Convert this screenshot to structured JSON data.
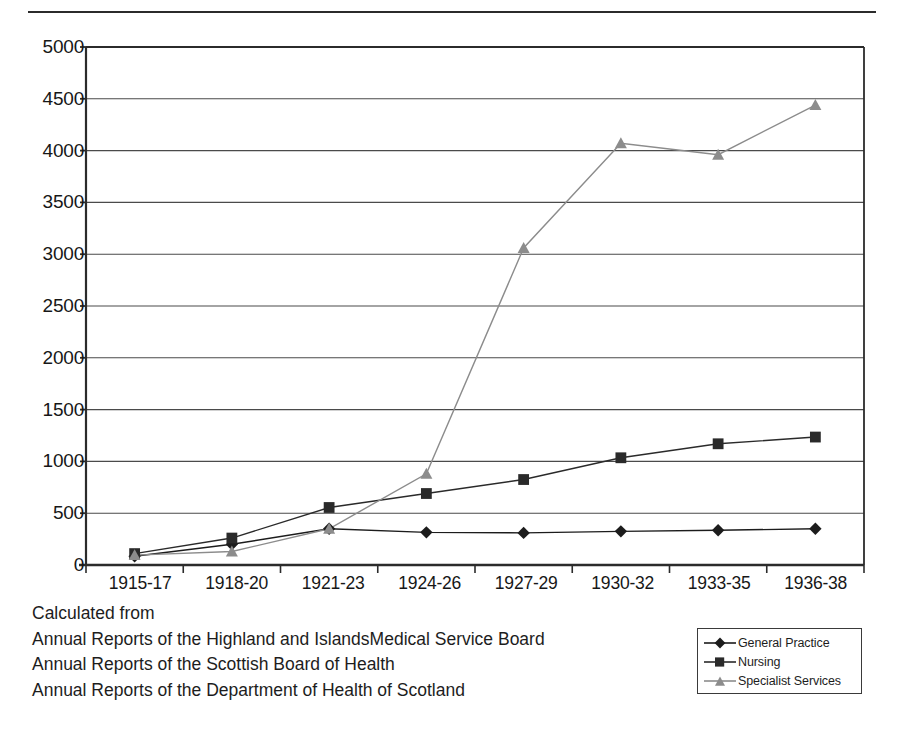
{
  "chart_data": {
    "type": "line",
    "title": "",
    "subtitle": "",
    "xlabel": "",
    "ylabel": "",
    "categories": [
      "1915-17",
      "1918-20",
      "1921-23",
      "1924-26",
      "1927-29",
      "1930-32",
      "1933-35",
      "1936-38"
    ],
    "series": [
      {
        "name": "General Practice",
        "marker": "diamond",
        "color": "#1c1c1c",
        "values": [
          85,
          200,
          350,
          315,
          310,
          325,
          335,
          350
        ]
      },
      {
        "name": "Nursing",
        "marker": "square",
        "color": "#2a2a2a",
        "values": [
          110,
          260,
          555,
          690,
          825,
          1035,
          1170,
          1235
        ]
      },
      {
        "name": "Specialist Services",
        "marker": "triangle",
        "color": "#8c8c8c",
        "values": [
          95,
          130,
          350,
          880,
          3060,
          4070,
          3960,
          4440
        ]
      }
    ],
    "ylim": [
      0,
      5000
    ],
    "yticks": [
      0,
      500,
      1000,
      1500,
      2000,
      2500,
      3000,
      3500,
      4000,
      4500,
      5000
    ],
    "ytick_labels": [
      "0",
      "500",
      "1000",
      "1500",
      "2000",
      "2500",
      "3000",
      "3500",
      "4000",
      "4500",
      "5000"
    ],
    "grid": "horizontal",
    "legend_position": "bottom-right"
  },
  "y_axis": {
    "ticks": [
      "5000",
      "4500",
      "4000",
      "3500",
      "3000",
      "2500",
      "2000",
      "1500",
      "1000",
      "500",
      "0"
    ]
  },
  "x_axis": {
    "ticks": [
      "1915-17",
      "1918-20",
      "1921-23",
      "1924-26",
      "1927-29",
      "1930-32",
      "1933-35",
      "1936-38"
    ]
  },
  "legend": {
    "entries": [
      {
        "label": "General Practice",
        "marker": "diamond",
        "color": "#1c1c1c"
      },
      {
        "label": "Nursing",
        "marker": "square",
        "color": "#2a2a2a"
      },
      {
        "label": "Specialist Services",
        "marker": "triangle",
        "color": "#8c8c8c"
      }
    ]
  },
  "source_note": {
    "lines": [
      "Calculated from",
      "Annual Reports of the Highland and IslandsMedical Service Board",
      "Annual Reports of the Scottish Board of Health",
      "Annual Reports of the Department of Health of Scotland"
    ]
  },
  "colors": {
    "axis": "#2b2b2b",
    "grid": "#4a4a4a",
    "background": "#ffffff",
    "text": "#1a1a1a"
  }
}
